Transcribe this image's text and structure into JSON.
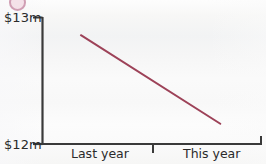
{
  "chart_data": {
    "type": "line",
    "title": "",
    "xlabel": "",
    "ylabel": "",
    "ylim": [
      12,
      13
    ],
    "y_unit": "$m",
    "y_ticks": [
      "$12m",
      "$13m"
    ],
    "grid": false,
    "legend": null,
    "categories": [
      "Last year",
      "This year"
    ],
    "series": [
      {
        "name": "",
        "color": "#9d4258",
        "x": [
          0.35,
          1.62
        ],
        "values": [
          12.86,
          12.16
        ],
        "points": [
          {
            "x_label": "Last year",
            "value": 12.86
          },
          {
            "x_label": "This year",
            "value": 12.16
          }
        ]
      }
    ],
    "axis_color": "#3a3a3a",
    "background": "#fbfbfa"
  },
  "axes": {
    "y_top_label": "$13m",
    "y_bottom_label": "$12m"
  },
  "categories": [
    {
      "label": "Last year"
    },
    {
      "label": "This year"
    }
  ],
  "colors": {
    "line": "#9d4258",
    "axis": "#3a3a3a",
    "text": "#2b2b2b",
    "background": "#fbfbfa",
    "corner_mark": "#c98fa8"
  }
}
